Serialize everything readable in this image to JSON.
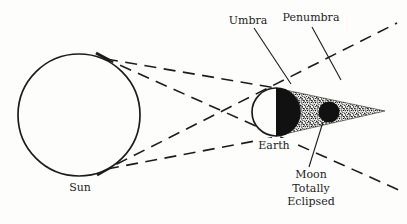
{
  "diagram": {
    "labels": {
      "sun": "Sun",
      "earth": "Earth",
      "umbra": "Umbra",
      "penumbra": "Penumbra",
      "moon_line_1": "Moon",
      "moon_line_2": "Totally",
      "moon_line_3": "Eclipsed"
    },
    "colors": {
      "ink": "#1c1c1c",
      "background": "#fdfdfb",
      "shadow_fill": "#111111"
    }
  }
}
